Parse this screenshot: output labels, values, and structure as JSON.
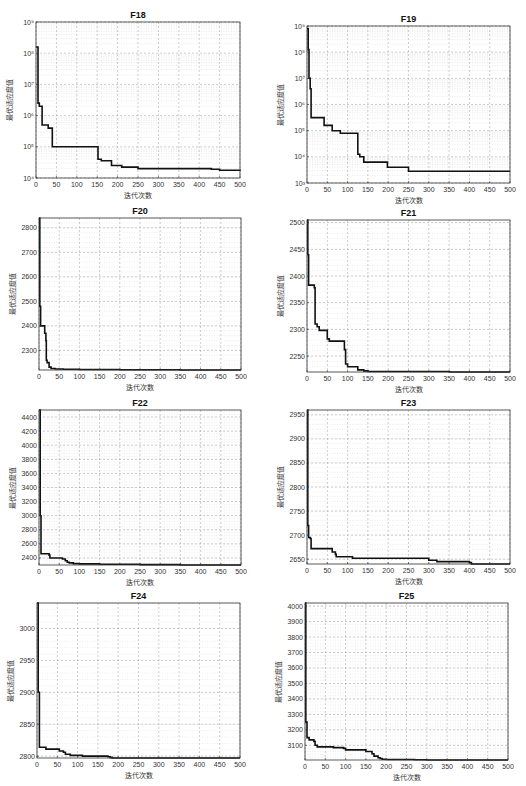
{
  "chart_data": [
    {
      "id": "F18",
      "type": "line",
      "title": "F18",
      "xlabel": "迭代次数",
      "ylabel": "最优适应度值",
      "yscale": "log",
      "xlim": [
        0,
        500
      ],
      "ylim_exp": [
        4,
        9
      ],
      "xticks": [
        0,
        50,
        100,
        150,
        200,
        250,
        300,
        350,
        400,
        450,
        500
      ],
      "yticks": [
        4,
        5,
        6,
        7,
        8,
        9
      ],
      "grid": true,
      "x": [
        0,
        3,
        5,
        8,
        14,
        15,
        18,
        30,
        38,
        40,
        150,
        152,
        160,
        185,
        210,
        250,
        430,
        450,
        500
      ],
      "y_log10": [
        8.2,
        8.2,
        6.4,
        6.3,
        6.3,
        5.7,
        5.7,
        5.6,
        5.6,
        5.0,
        5.0,
        4.6,
        4.55,
        4.4,
        4.35,
        4.3,
        4.28,
        4.25,
        4.22
      ]
    },
    {
      "id": "F19",
      "type": "line",
      "title": "F19",
      "xlabel": "迭代次数",
      "ylabel": "最优适应度值",
      "yscale": "log",
      "xlim": [
        0,
        500
      ],
      "ylim_exp": [
        3,
        9
      ],
      "xticks": [
        0,
        50,
        100,
        150,
        200,
        250,
        300,
        350,
        400,
        450,
        500
      ],
      "yticks": [
        3,
        4,
        5,
        6,
        7,
        8,
        9
      ],
      "grid": true,
      "x": [
        0,
        3,
        5,
        8,
        10,
        15,
        40,
        42,
        60,
        62,
        80,
        82,
        122,
        125,
        130,
        140,
        195,
        198,
        247,
        250,
        500
      ],
      "y_log10": [
        8.9,
        8.1,
        7.0,
        6.6,
        5.5,
        5.5,
        5.5,
        5.2,
        5.2,
        5.0,
        5.0,
        4.9,
        4.9,
        4.1,
        4.0,
        3.8,
        3.8,
        3.6,
        3.6,
        3.45,
        3.45
      ]
    },
    {
      "id": "F20",
      "type": "line",
      "title": "F20",
      "xlabel": "迭代次数",
      "ylabel": "最优适应度值",
      "yscale": "linear",
      "xlim": [
        0,
        500
      ],
      "ylim": [
        2220,
        2840
      ],
      "xticks": [
        0,
        50,
        100,
        150,
        200,
        250,
        300,
        350,
        400,
        450,
        500
      ],
      "yticks": [
        2300,
        2400,
        2500,
        2600,
        2700,
        2800
      ],
      "grid": true,
      "x": [
        0,
        2,
        4,
        12,
        14,
        17,
        18,
        20,
        25,
        30,
        40,
        60,
        100,
        200,
        350,
        500
      ],
      "y": [
        2840,
        2480,
        2400,
        2400,
        2370,
        2340,
        2260,
        2250,
        2232,
        2226,
        2224,
        2223,
        2222,
        2221,
        2220,
        2220
      ]
    },
    {
      "id": "F21",
      "type": "line",
      "title": "F21",
      "xlabel": "迭代次数",
      "ylabel": "最优适应度值",
      "yscale": "linear",
      "xlim": [
        0,
        500
      ],
      "ylim": [
        2220,
        2505
      ],
      "xticks": [
        0,
        50,
        100,
        150,
        200,
        250,
        300,
        350,
        400,
        450,
        500
      ],
      "yticks": [
        2250,
        2300,
        2350,
        2400,
        2450,
        2500
      ],
      "grid": true,
      "x": [
        0,
        2,
        4,
        15,
        18,
        20,
        25,
        30,
        48,
        50,
        55,
        90,
        92,
        95,
        100,
        120,
        125,
        140,
        150,
        200,
        350,
        500
      ],
      "y": [
        2505,
        2440,
        2383,
        2383,
        2378,
        2310,
        2305,
        2298,
        2298,
        2282,
        2278,
        2278,
        2262,
        2235,
        2230,
        2230,
        2224,
        2222,
        2221,
        2221,
        2220,
        2220
      ]
    },
    {
      "id": "F22",
      "type": "line",
      "title": "F22",
      "xlabel": "迭代次数",
      "ylabel": "最优适应度值",
      "yscale": "linear",
      "xlim": [
        0,
        500
      ],
      "ylim": [
        2300,
        4500
      ],
      "xticks": [
        0,
        50,
        100,
        150,
        200,
        250,
        300,
        350,
        400,
        450,
        500
      ],
      "yticks": [
        2400,
        2600,
        2800,
        3000,
        3200,
        3400,
        3600,
        3800,
        4000,
        4200,
        4400
      ],
      "grid": true,
      "x": [
        0,
        3,
        5,
        25,
        27,
        50,
        58,
        65,
        70,
        75,
        85,
        100,
        150,
        250,
        350,
        500
      ],
      "y": [
        4500,
        3000,
        2460,
        2440,
        2400,
        2400,
        2385,
        2360,
        2340,
        2330,
        2320,
        2315,
        2312,
        2305,
        2300,
        2298
      ]
    },
    {
      "id": "F23",
      "type": "line",
      "title": "F23",
      "xlabel": "迭代次数",
      "ylabel": "最优适应度值",
      "yscale": "linear",
      "xlim": [
        0,
        500
      ],
      "ylim": [
        2640,
        2960
      ],
      "xticks": [
        0,
        50,
        100,
        150,
        200,
        250,
        300,
        350,
        400,
        450,
        500
      ],
      "yticks": [
        2650,
        2700,
        2750,
        2800,
        2850,
        2900,
        2950
      ],
      "grid": true,
      "x": [
        0,
        2,
        4,
        8,
        10,
        60,
        62,
        70,
        72,
        110,
        112,
        295,
        300,
        320,
        400,
        405,
        420,
        500
      ],
      "y": [
        2960,
        2720,
        2695,
        2693,
        2672,
        2672,
        2665,
        2660,
        2655,
        2655,
        2652,
        2652,
        2648,
        2645,
        2643,
        2640,
        2638,
        2636
      ]
    },
    {
      "id": "F24",
      "type": "line",
      "title": "F24",
      "xlabel": "迭代次数",
      "ylabel": "最优适应度值",
      "yscale": "linear",
      "xlim": [
        0,
        500
      ],
      "ylim": [
        2797,
        3040
      ],
      "xticks": [
        0,
        50,
        100,
        150,
        200,
        250,
        300,
        350,
        400,
        450,
        500
      ],
      "yticks": [
        2800,
        2850,
        2900,
        2950,
        3000
      ],
      "grid": true,
      "x": [
        0,
        3,
        6,
        20,
        22,
        50,
        55,
        65,
        70,
        80,
        82,
        110,
        112,
        170,
        175,
        180,
        185,
        260,
        265,
        500
      ],
      "y": [
        3040,
        2900,
        2814,
        2814,
        2811,
        2811,
        2808,
        2806,
        2803,
        2803,
        2801,
        2801,
        2800,
        2800,
        2799,
        2798,
        2797,
        2797,
        2796,
        2796
      ]
    },
    {
      "id": "F25",
      "type": "line",
      "title": "F25",
      "xlabel": "迭代次数",
      "ylabel": "最优适应度值",
      "yscale": "linear",
      "xlim": [
        0,
        500
      ],
      "ylim": [
        3005,
        4020
      ],
      "xticks": [
        0,
        50,
        100,
        150,
        200,
        250,
        300,
        350,
        400,
        450,
        500
      ],
      "yticks": [
        3100,
        3200,
        3300,
        3400,
        3500,
        3600,
        3700,
        3800,
        3900,
        4000
      ],
      "grid": true,
      "x": [
        0,
        2,
        5,
        10,
        22,
        25,
        30,
        70,
        95,
        100,
        150,
        165,
        170,
        180,
        185,
        190,
        200,
        270,
        300,
        500
      ],
      "y": [
        4020,
        3250,
        3150,
        3135,
        3125,
        3100,
        3090,
        3085,
        3080,
        3070,
        3060,
        3045,
        3030,
        3020,
        3015,
        3010,
        3008,
        3006,
        3005,
        3005
      ]
    }
  ],
  "layout": [
    {
      "left": 36,
      "top": 22,
      "width": 204,
      "height": 156
    },
    {
      "left": 307,
      "top": 26,
      "width": 203,
      "height": 157
    },
    {
      "left": 39,
      "top": 218,
      "width": 202,
      "height": 152
    },
    {
      "left": 307,
      "top": 220,
      "width": 203,
      "height": 152
    },
    {
      "left": 39,
      "top": 410,
      "width": 202,
      "height": 155
    },
    {
      "left": 307,
      "top": 410,
      "width": 203,
      "height": 154
    },
    {
      "left": 37,
      "top": 603,
      "width": 203,
      "height": 155
    },
    {
      "left": 305,
      "top": 603,
      "width": 203,
      "height": 157
    }
  ],
  "style": {
    "line_color": "#111111",
    "grid_color": "#9a9a9a",
    "axis_color": "#333333"
  }
}
